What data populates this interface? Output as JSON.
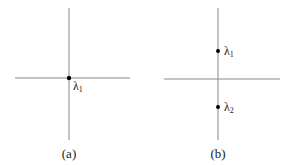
{
  "panels": [
    {
      "caption": "(a)",
      "points": [
        {
          "label": "λ",
          "sub": "1"
        }
      ]
    },
    {
      "caption": "(b)",
      "points": [
        {
          "label": "λ",
          "sub": "1"
        },
        {
          "label": "λ",
          "sub": "2"
        }
      ]
    }
  ],
  "colors": {
    "axis": "#888888",
    "point": "#000000",
    "text": "#222222"
  }
}
